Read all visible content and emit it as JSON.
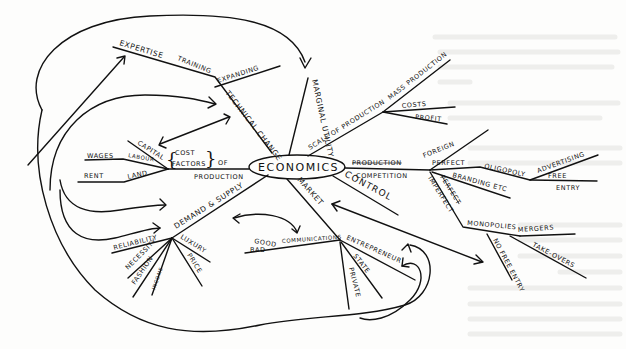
{
  "diagram": {
    "type": "hand-drawn mind map",
    "colors": {
      "ink": "#111111",
      "paper": "#fdfdfc",
      "showthrough": "#eeeeec"
    },
    "center": "ECONOMICS",
    "branches": {
      "technical_change": {
        "label": "TECHNICAL CHANGE",
        "children": [
          "EXPERTISE",
          "TRAINING",
          "EXPANDING"
        ]
      },
      "marginal_utility": {
        "label": "MARGINAL UTILITY"
      },
      "scale_of_production": {
        "label": "SCALE OF PRODUCTION",
        "children": [
          "MASS PRODUCTION",
          "COSTS",
          "PROFIT"
        ]
      },
      "competition": {
        "label": "COMPETITION",
        "crossed_out": "PRODUCTION",
        "children": {
          "foreign": "FOREIGN",
          "perfect": "PERFECT",
          "oligopoly": "OLIGOPOLY",
          "advertising": "ADVERTISING",
          "free": "FREE",
          "entry": "ENTRY",
          "branding": "BRANDING ETC",
          "imperfect": "IMPERFECT",
          "crossed_imperfect": "PERFECT",
          "monopolies": "MONOPOLIES",
          "mergers": "MERGERS",
          "takeovers": "TAKE-OVERS",
          "no_free_entry": "NO FREE ENTRY"
        }
      },
      "control": {
        "label": "CONTROL"
      },
      "market": {
        "label": "MARKET",
        "children": [
          "GOOD",
          "COMMUNICATIONS",
          "BAD",
          "ENTREPRENEUR",
          "STATE",
          "PRIVATE"
        ]
      },
      "demand_supply": {
        "label": "DEMAND & SUPPLY",
        "children": [
          "RELIABILITY",
          "NECESSITY",
          "FASHION",
          "INCOME",
          "LUXURY",
          "PRICE"
        ]
      },
      "factors_of_production": {
        "label_cost": "COST",
        "label_factors": "FACTORS",
        "label_of": "OF",
        "label_production": "PRODUCTION",
        "children": [
          "CAPITAL",
          "WAGES",
          "LABOUR",
          "RENT",
          "LAND"
        ]
      }
    }
  }
}
